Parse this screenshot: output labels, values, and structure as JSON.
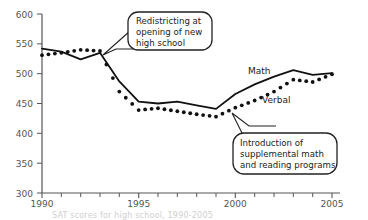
{
  "chart_data": {
    "type": "line",
    "title": "",
    "xlabel": "",
    "ylabel": "",
    "xlim": [
      1990,
      2005
    ],
    "ylim": [
      300,
      600
    ],
    "grid": false,
    "legend_position": "inline-labels",
    "x": [
      1990,
      1991,
      1992,
      1993,
      1994,
      1995,
      1996,
      1997,
      1998,
      1999,
      2000,
      2001,
      2002,
      2003,
      2004,
      2005
    ],
    "xticks": [
      "1990",
      "1995",
      "2000",
      "2005"
    ],
    "xtick_values": [
      1990,
      1995,
      2000,
      2005
    ],
    "yticks": [
      "300",
      "350",
      "400",
      "450",
      "500",
      "550",
      "600"
    ],
    "ytick_values": [
      300,
      350,
      400,
      450,
      500,
      550,
      600
    ],
    "series": [
      {
        "name": "Math",
        "style": "solid",
        "values": [
          542,
          537,
          524,
          535,
          487,
          453,
          450,
          453,
          447,
          441,
          466,
          482,
          495,
          506,
          498,
          501
        ]
      },
      {
        "name": "Verbal",
        "style": "dotted",
        "values": [
          531,
          535,
          540,
          538,
          470,
          439,
          442,
          437,
          432,
          428,
          443,
          455,
          470,
          490,
          486,
          499
        ]
      }
    ],
    "annotations": [
      {
        "name": "redistricting",
        "text": "Redistricting at opening of new high school",
        "lines": [
          "Redistricting at",
          "opening of new",
          "high school"
        ],
        "points_to": [
          1993,
          535
        ]
      },
      {
        "name": "supplemental-programs",
        "text": "Introduction of supplemental math and reading programs",
        "lines": [
          "Introduction of",
          "supplemental math",
          "and reading programs"
        ],
        "points_to": [
          1999,
          434
        ]
      }
    ]
  },
  "caption": {
    "text": "SAT scores for high school, 1990-2005"
  },
  "axis": {
    "ytick_labels": [
      "600",
      "550",
      "500",
      "450",
      "400",
      "350",
      "300"
    ],
    "xtick_labels": [
      "1990",
      "1995",
      "2000",
      "2005"
    ]
  },
  "labels": {
    "math": "Math",
    "verbal": "Verbal"
  },
  "callouts": {
    "top": {
      "line1": "Redistricting at",
      "line2": "opening of new",
      "line3": "high school"
    },
    "bottom": {
      "line1": "Introduction of",
      "line2": "supplemental math",
      "line3": "and reading programs"
    }
  },
  "colors": {
    "axis": "#555555",
    "series": "#111111",
    "text": "#222222",
    "caption": "#cfcfcf",
    "background": "#ffffff"
  }
}
